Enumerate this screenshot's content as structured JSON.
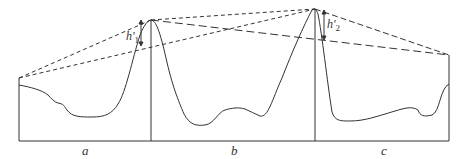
{
  "diagram": {
    "type": "terrain-profile",
    "segments": [
      {
        "label": "a"
      },
      {
        "label": "b"
      },
      {
        "label": "c"
      }
    ],
    "heights": [
      {
        "symbol": "h'",
        "subscript": "1"
      },
      {
        "symbol": "h'",
        "subscript": "2"
      }
    ],
    "colors": {
      "line": "#333333",
      "background": "#ffffff"
    }
  }
}
